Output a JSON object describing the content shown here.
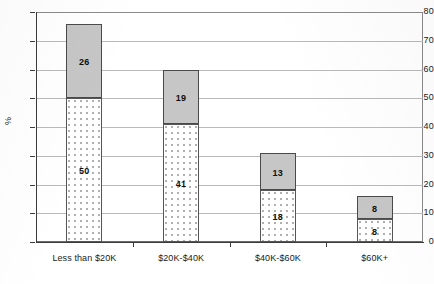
{
  "chart_data": {
    "type": "bar",
    "subtype": "stacked-bar",
    "title": "",
    "xlabel": "",
    "ylabel": "%",
    "ylim": [
      0,
      80
    ],
    "ytick_step": 10,
    "yticks": [
      0,
      10,
      20,
      30,
      40,
      50,
      60,
      70,
      80
    ],
    "grid": "horizontal",
    "legend": "none",
    "categories": [
      "Less than $20K",
      "$20K-$40K",
      "$40K-$60K",
      "$60K+"
    ],
    "series": [
      {
        "name": "lower-segment",
        "pattern": "dotted",
        "values": [
          50,
          41,
          18,
          8
        ]
      },
      {
        "name": "upper-segment",
        "pattern": "solid-gray",
        "values": [
          26,
          19,
          13,
          8
        ]
      }
    ],
    "totals": [
      76,
      60,
      31,
      16
    ],
    "colors": {
      "upper_segment": "#c6c6c6",
      "lower_segment": "#ffffff",
      "lower_segment_dots": "#b0b0b0",
      "bar_border": "#4a4a4a",
      "gridline": "#b9b9b9",
      "axis": "#3b3b3b",
      "text": "#1a1a1a",
      "background": "#ffffff"
    }
  },
  "axes": {
    "y": {
      "label": "%",
      "tick_labels": [
        "0",
        "10",
        "20",
        "30",
        "40",
        "50",
        "60",
        "70",
        "80"
      ]
    },
    "x": {
      "tick_labels": [
        "Less than $20K",
        "$20K-$40K",
        "$40K-$60K",
        "$60K+"
      ]
    }
  },
  "bars": [
    {
      "category": "Less than $20K",
      "lower_value": 50,
      "upper_value": 26,
      "lower_label": "50",
      "upper_label": "26",
      "total": 76
    },
    {
      "category": "$20K-$40K",
      "lower_value": 41,
      "upper_value": 19,
      "lower_label": "41",
      "upper_label": "19",
      "total": 60
    },
    {
      "category": "$40K-$60K",
      "lower_value": 18,
      "upper_value": 13,
      "lower_label": "18",
      "upper_label": "13",
      "total": 31
    },
    {
      "category": "$60K+",
      "lower_value": 8,
      "upper_value": 8,
      "lower_label": "8",
      "upper_label": "8",
      "total": 16
    }
  ]
}
